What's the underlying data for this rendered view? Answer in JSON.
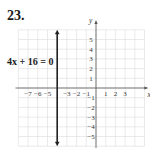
{
  "problem_number": "23.",
  "equation_label": "4x + 16 = 0",
  "chart_data": {
    "type": "line",
    "title": "",
    "xlabel": "x",
    "ylabel": "y",
    "xlim": [
      -8,
      5
    ],
    "ylim": [
      -6,
      6
    ],
    "grid": true,
    "x_tick_labels": [
      "-7",
      "-6",
      "-5",
      "-3",
      "-2",
      "-1",
      "1",
      "2",
      "3"
    ],
    "y_tick_labels": [
      "5",
      "4",
      "3",
      "2",
      "1",
      "-1",
      "-2",
      "-3",
      "-4",
      "-5"
    ],
    "series": [
      {
        "name": "4x + 16 = 0",
        "type": "vertical_line",
        "x": -4,
        "y_range": [
          -6,
          6
        ],
        "arrows": "both",
        "color": "#222222"
      }
    ],
    "annotations": [
      {
        "text": "4x + 16 = 0",
        "position": "left of line"
      }
    ]
  },
  "colors": {
    "grid": "#dcdcdc",
    "axis": "#555555",
    "line": "#222222",
    "text": "#333333"
  }
}
